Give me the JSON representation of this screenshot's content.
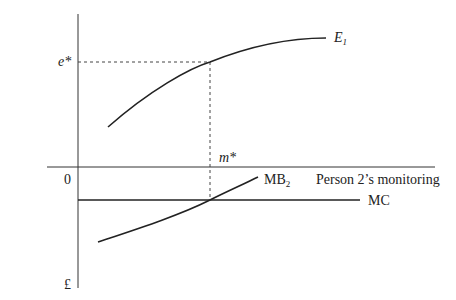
{
  "diagram": {
    "y_axis_label": "Person 1’s effort",
    "x_axis_label": "Person 2’s monitoring",
    "origin_label": "0",
    "y_lower_label": "£",
    "e_star_label": "e*",
    "m_star_label": "m*",
    "curves": {
      "E1": {
        "name": "E",
        "subscript": "1"
      },
      "MB2": {
        "name": "MB",
        "subscript": "2"
      },
      "MC": {
        "name": "MC"
      }
    },
    "colors": {
      "line": "#222222",
      "axis": "#333333",
      "dash": "#444444"
    }
  }
}
